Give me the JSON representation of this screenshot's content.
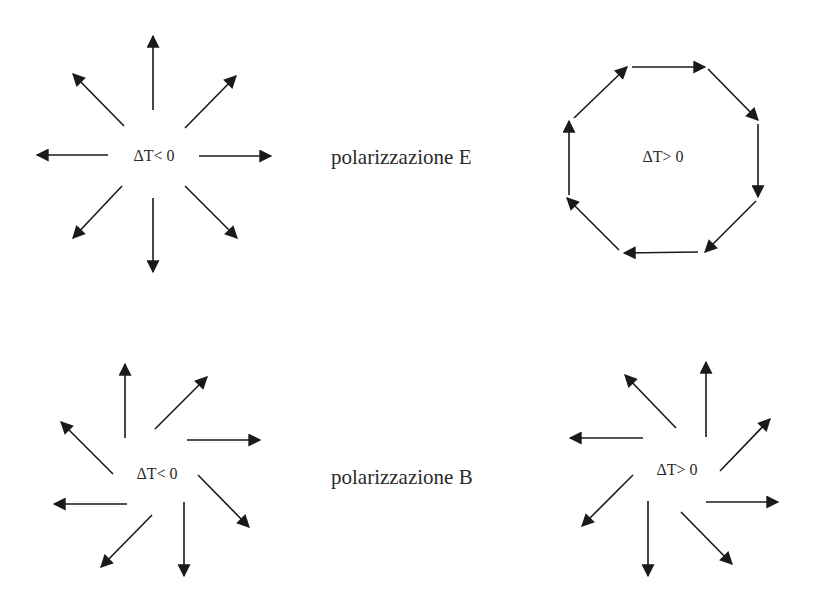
{
  "figure": {
    "colors": {
      "background": "#ffffff",
      "arrows": "#1a1a1a",
      "text": "#2a2a2a"
    },
    "rows": [
      {
        "label": "polarizzazione E",
        "left_panel": {
          "condition": "ΔT< 0",
          "pattern": "radial",
          "arrow_count": 8
        },
        "right_panel": {
          "condition": "ΔT> 0",
          "pattern": "tangential-octagon",
          "arrow_count": 8
        }
      },
      {
        "label": "polarizzazione B",
        "left_panel": {
          "condition": "ΔT< 0",
          "pattern": "pinwheel-counterclockwise",
          "arrow_count": 8
        },
        "right_panel": {
          "condition": "ΔT> 0",
          "pattern": "pinwheel-clockwise",
          "arrow_count": 8
        }
      }
    ]
  }
}
